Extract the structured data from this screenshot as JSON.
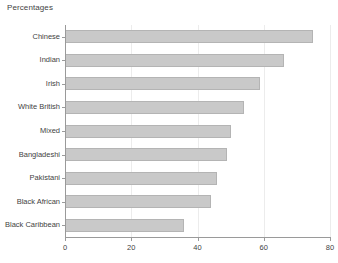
{
  "chart_data": {
    "type": "bar",
    "orientation": "horizontal",
    "title": "Percentages",
    "xlabel": "",
    "ylabel": "",
    "categories": [
      "Chinese",
      "Indian",
      "Irish",
      "White British",
      "Mixed",
      "Bangladeshi",
      "Pakistani",
      "Black African",
      "Black Caribbean"
    ],
    "values": [
      75,
      66,
      59,
      54,
      50,
      49,
      46,
      44,
      36
    ],
    "xlim": [
      0,
      80
    ],
    "xticks": [
      0,
      20,
      40,
      60,
      80
    ],
    "xtick_labels": [
      "0",
      "20",
      "40",
      "60",
      "80"
    ],
    "grid": true,
    "grid_axis": "x",
    "legend": false,
    "bar_color": "#c9c9c9",
    "bar_border_color": "#b4b4b4",
    "axis_color": "#9a9a9a",
    "grid_color": "#ececec",
    "text_color": "#3f3f3f",
    "background": "#ffffff"
  }
}
